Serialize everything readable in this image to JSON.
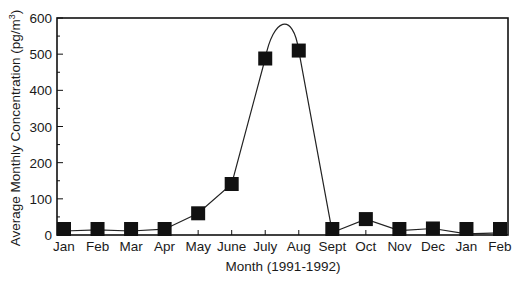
{
  "chart_data": {
    "type": "line",
    "title": "",
    "xlabel": "Month (1991-1992)",
    "ylabel": "Average Monthly Concentration (pg/m³)",
    "ylabel_main": "Average Monthly Concentration (pg/m",
    "ylabel_sup": "3",
    "ylabel_close": ")",
    "categories": [
      "Jan",
      "Feb",
      "Mar",
      "Apr",
      "May",
      "June",
      "July",
      "Aug",
      "Sept",
      "Oct",
      "Nov",
      "Dec",
      "Jan",
      "Feb"
    ],
    "series": [
      {
        "name": "Average Monthly Concentration",
        "values": [
          11,
          14,
          11,
          16,
          60,
          141,
          488,
          510,
          7,
          44,
          12,
          18,
          3,
          6
        ],
        "marker": "square",
        "color": "#111111",
        "smooth_peak": true
      }
    ],
    "yticks": [
      0,
      100,
      200,
      300,
      400,
      500,
      600
    ],
    "ylim": [
      0,
      600
    ],
    "grid": false,
    "legend": "none"
  }
}
